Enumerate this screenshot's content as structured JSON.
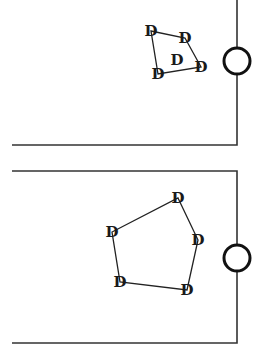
{
  "diagram": {
    "panels": [
      {
        "name": "panel-top",
        "wall": {
          "x_left": 12,
          "x_right": 237,
          "y_top": 0,
          "y_bottom": 145
        },
        "port": {
          "cx": 237,
          "cy": 61,
          "r": 13
        },
        "nodes": [
          {
            "label": "D",
            "x": 151,
            "y": 31
          },
          {
            "label": "D",
            "x": 185,
            "y": 38
          },
          {
            "label": "D",
            "x": 201,
            "y": 67
          },
          {
            "label": "D",
            "x": 158,
            "y": 74
          }
        ],
        "center_node": {
          "label": "D",
          "x": 177,
          "y": 60
        }
      },
      {
        "name": "panel-bottom",
        "wall": {
          "x_left": 12,
          "x_right": 237,
          "y_top": 171,
          "y_bottom": 343
        },
        "port": {
          "cx": 237,
          "cy": 258,
          "r": 13
        },
        "nodes": [
          {
            "label": "D",
            "x": 178,
            "y": 198
          },
          {
            "label": "D",
            "x": 198,
            "y": 240
          },
          {
            "label": "D",
            "x": 187,
            "y": 290
          },
          {
            "label": "D",
            "x": 120,
            "y": 282
          },
          {
            "label": "D",
            "x": 112,
            "y": 232
          }
        ]
      }
    ]
  }
}
